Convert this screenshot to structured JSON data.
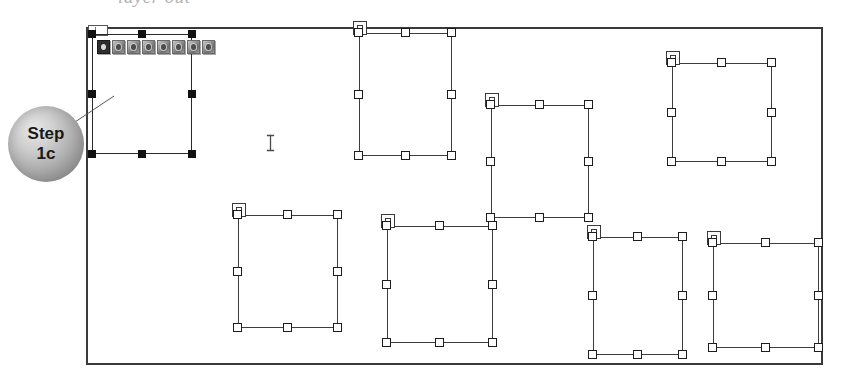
{
  "window": {
    "clipped_heading": "layer out",
    "frame": {
      "x": 86,
      "y": 27,
      "width": 737,
      "height": 338
    }
  },
  "callout": {
    "line1": "Step",
    "line2": "1c",
    "name": "step-1c-callout"
  },
  "cursor": {
    "type": "i-beam",
    "glyph": "I",
    "x": 268,
    "y": 143
  },
  "icon_strip": {
    "count": 8,
    "selected_index": 0,
    "icons": [
      {
        "name": "app-icon-1",
        "state": "selected"
      },
      {
        "name": "app-icon-2",
        "state": "normal"
      },
      {
        "name": "app-icon-3",
        "state": "normal"
      },
      {
        "name": "app-icon-4",
        "state": "normal"
      },
      {
        "name": "app-icon-5",
        "state": "normal"
      },
      {
        "name": "app-icon-6",
        "state": "normal"
      },
      {
        "name": "app-icon-7",
        "state": "normal"
      },
      {
        "name": "app-icon-8",
        "state": "normal"
      }
    ]
  },
  "shapes": [
    {
      "id": "shape-1",
      "name": "selected-container",
      "selected": true,
      "anchor": false,
      "x": 92,
      "y": 34,
      "w": 100,
      "h": 120
    },
    {
      "id": "shape-2",
      "name": "container-2",
      "selected": false,
      "anchor": true,
      "x": 359,
      "y": 33,
      "w": 93,
      "h": 123
    },
    {
      "id": "shape-3",
      "name": "container-3",
      "selected": false,
      "anchor": true,
      "x": 491,
      "y": 105,
      "w": 98,
      "h": 113
    },
    {
      "id": "shape-4",
      "name": "container-4",
      "selected": false,
      "anchor": true,
      "x": 672,
      "y": 63,
      "w": 100,
      "h": 99
    },
    {
      "id": "shape-5",
      "name": "container-5",
      "selected": false,
      "anchor": true,
      "x": 238,
      "y": 215,
      "w": 100,
      "h": 113
    },
    {
      "id": "shape-6",
      "name": "container-6",
      "selected": false,
      "anchor": true,
      "x": 387,
      "y": 226,
      "w": 106,
      "h": 117
    },
    {
      "id": "shape-7",
      "name": "container-7",
      "selected": false,
      "anchor": true,
      "x": 593,
      "y": 237,
      "w": 90,
      "h": 118
    },
    {
      "id": "shape-8",
      "name": "container-8",
      "selected": false,
      "anchor": true,
      "x": 713,
      "y": 243,
      "w": 106,
      "h": 105
    }
  ],
  "colors": {
    "frame_border": "#3a3a3a",
    "shape_outline": "#3d3d3d",
    "handle_fill_unselected": "#ffffff",
    "handle_fill_selected": "#111111",
    "callout_fill": "#ababab",
    "background": "#ffffff"
  }
}
